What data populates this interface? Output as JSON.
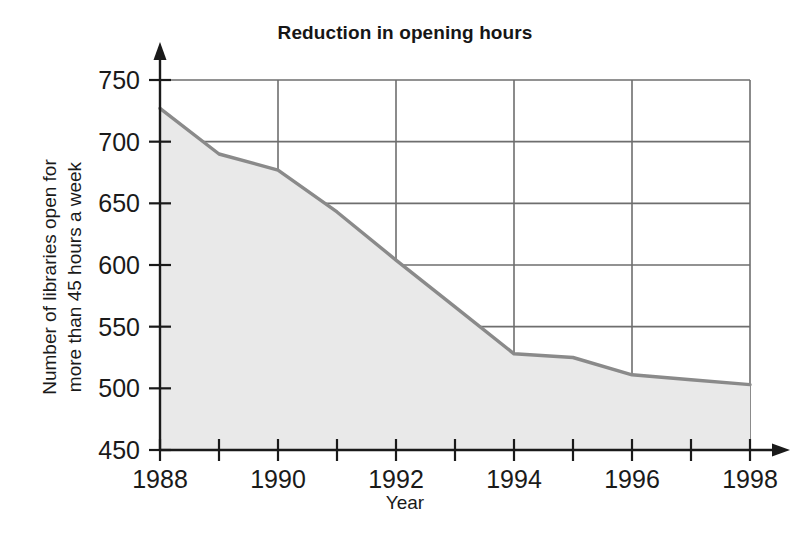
{
  "chart_data": {
    "type": "area",
    "title": "Reduction in opening hours",
    "xlabel": "Year",
    "ylabel_line1": "Number of libraries open for",
    "ylabel_line2": "more than 45 hours a week",
    "x": [
      1988,
      1989,
      1990,
      1991,
      1992,
      1993,
      1994,
      1995,
      1996,
      1997,
      1998
    ],
    "values": [
      727,
      690,
      677,
      643,
      604,
      566,
      528,
      525,
      511,
      507,
      503
    ],
    "xlim": [
      1988,
      1998
    ],
    "ylim": [
      450,
      750
    ],
    "xticks": [
      1988,
      1989,
      1990,
      1991,
      1992,
      1993,
      1994,
      1995,
      1996,
      1997,
      1998
    ],
    "xtick_labels_shown": [
      "1988",
      "",
      "1990",
      "",
      "1992",
      "",
      "1994",
      "",
      "1996",
      "",
      "1998"
    ],
    "yticks": [
      450,
      500,
      550,
      600,
      650,
      700,
      750
    ],
    "ytick_labels": [
      "450",
      "500",
      "550",
      "600",
      "650",
      "700",
      "750"
    ],
    "grid": true,
    "grid_x_years": [
      1990,
      1992,
      1994,
      1996,
      1998
    ],
    "legend": null,
    "series_name": "Number of libraries open for more than 45 hours a week",
    "colors": {
      "line": "#8a8a8a",
      "fill": "#e9e9e9",
      "grid": "#6e6e6e",
      "axis": "#1a1a1a",
      "text": "#1a1a1a",
      "background": "#ffffff"
    }
  }
}
